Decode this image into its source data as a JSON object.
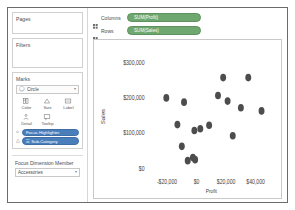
{
  "sidebar": {
    "pages": {
      "title": "Pages"
    },
    "filters": {
      "title": "Filters"
    },
    "marks": {
      "title": "Marks",
      "type_icon": "circle-mark-icon",
      "type_value": "Circle",
      "caret": "▾",
      "buttons": [
        {
          "name": "color",
          "label": "Color",
          "icon": "color-palette-icon"
        },
        {
          "name": "size",
          "label": "Size",
          "icon": "size-icon"
        },
        {
          "name": "label",
          "label": "Label",
          "icon": "label-icon"
        },
        {
          "name": "detail",
          "label": "Detail",
          "icon": "detail-icon"
        },
        {
          "name": "tooltip",
          "label": "Tooltip",
          "icon": "tooltip-icon"
        }
      ],
      "pills": [
        {
          "name": "focus-highlighter",
          "label": "Focus Highlighter",
          "glyph": "⌂",
          "color": "#4a7ebb"
        },
        {
          "name": "sub-category",
          "label": "☷ Sub-Category",
          "glyph": "△",
          "color": "#4a7ebb"
        }
      ]
    },
    "focus": {
      "label": "Focus Dimension Member",
      "value": "Accessories",
      "caret": "▾"
    }
  },
  "shelves": [
    {
      "name": "columns",
      "label": "Columns",
      "pill": "SUM(Profit)"
    },
    {
      "name": "rows",
      "label": "Rows",
      "pill": "SUM(Sales)"
    }
  ],
  "colors": {
    "measure_pill": "#6fa86f",
    "dimension_pill": "#4a7ebb",
    "mark": "#4d4d4d"
  },
  "chart_data": {
    "type": "scatter",
    "title": "",
    "xlabel": "Profit",
    "ylabel": "Sales",
    "xlim": [
      -32000,
      52000
    ],
    "ylim": [
      -15000,
      330000
    ],
    "xticks": [
      -20000,
      0,
      20000,
      40000
    ],
    "xticklabels": [
      "-$20,000",
      "$0",
      "$20,000",
      "$40,000"
    ],
    "yticks": [
      0,
      100000,
      200000,
      300000
    ],
    "yticklabels": [
      "$0",
      "$100,000",
      "$200,000",
      "$300,000"
    ],
    "grid": false,
    "legend": null,
    "series": [
      {
        "name": "Sub-Category",
        "color": "#4d4d4d",
        "points": [
          {
            "x": 18000,
            "y": 258000
          },
          {
            "x": 35000,
            "y": 258000
          },
          {
            "x": -20500,
            "y": 200000
          },
          {
            "x": 14500,
            "y": 207000
          },
          {
            "x": 21000,
            "y": 191000
          },
          {
            "x": -8500,
            "y": 188000
          },
          {
            "x": 30000,
            "y": 172000
          },
          {
            "x": 44000,
            "y": 163000
          },
          {
            "x": -13000,
            "y": 124000
          },
          {
            "x": 8500,
            "y": 122000
          },
          {
            "x": -1500,
            "y": 107000
          },
          {
            "x": 2500,
            "y": 112000
          },
          {
            "x": 24500,
            "y": 92000
          },
          {
            "x": -10000,
            "y": 62000
          },
          {
            "x": -6000,
            "y": 21000
          },
          {
            "x": -2500,
            "y": 30000
          },
          {
            "x": -1000,
            "y": 24000
          }
        ]
      }
    ]
  }
}
